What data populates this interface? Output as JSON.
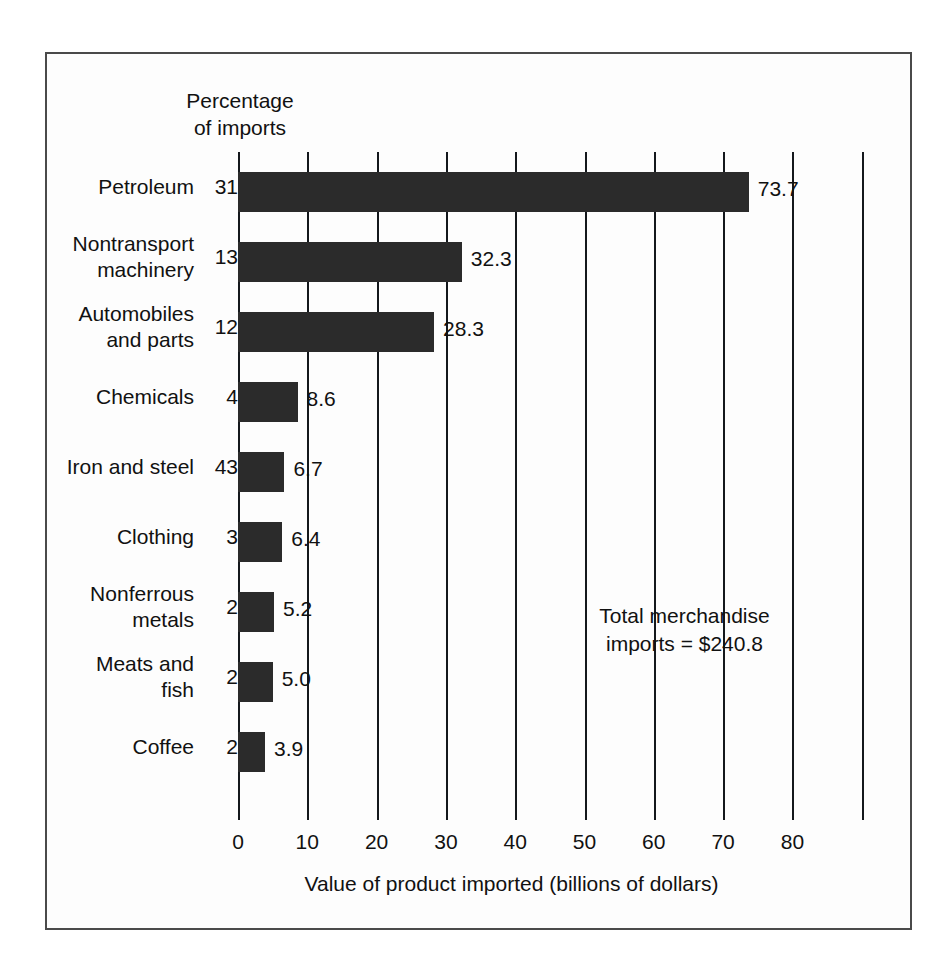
{
  "figure": {
    "percentage_header": "Percentage\nof imports",
    "annotation": "Total merchandise\nimports  =  $240.8",
    "x_axis_title": "Value of product imported (billions of dollars)"
  },
  "chart_data": {
    "type": "bar",
    "orientation": "horizontal",
    "title": "",
    "xlabel": "Value of product imported (billions of dollars)",
    "ylabel": "",
    "xlim": [
      0,
      90
    ],
    "grid": true,
    "legend": false,
    "xticks": [
      0,
      10,
      20,
      30,
      40,
      50,
      60,
      70,
      80
    ],
    "xtick_labels": [
      "0",
      "10",
      "20",
      "30",
      "40",
      "50",
      "60",
      "70",
      "80"
    ],
    "unlabeled_gridlines": [
      90
    ],
    "categories": [
      "Petroleum",
      "Nontransport\nmachinery",
      "Automobiles\nand parts",
      "Chemicals",
      "Iron and steel",
      "Clothing",
      "Nonferrous\nmetals",
      "Meats and\nfish",
      "Coffee"
    ],
    "values": [
      73.7,
      32.3,
      28.3,
      8.6,
      6.7,
      6.4,
      5.2,
      5.0,
      3.9
    ],
    "value_labels": [
      "73.7",
      "32.3",
      "28.3",
      "8.6",
      "6.7",
      "6.4",
      "5.2",
      "5.0",
      "3.9"
    ],
    "percentage_of_imports": [
      "31",
      "13",
      "12",
      "4",
      "43",
      "3",
      "2",
      "2",
      "2"
    ],
    "total_merchandise_imports": 240.8,
    "bar_color": "#2b2b2b",
    "background_color": "#fdfdfd",
    "axis_color": "#14181c"
  }
}
